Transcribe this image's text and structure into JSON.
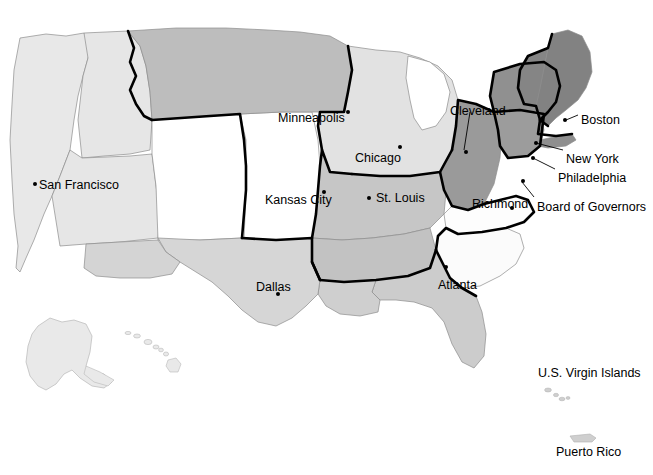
{
  "map": {
    "title": "Federal Reserve Districts Map of the United States",
    "colors": {
      "background": "#ffffff",
      "district_outline": "#000000",
      "state_outline": "#8c8c8c",
      "label_text": "#000000",
      "tone_white": "#ffffff",
      "tone_lightest": "#e8e8e8",
      "tone_lighter": "#dedede",
      "tone_light": "#d2d2d2",
      "tone_mid": "#bdbdbd",
      "tone_dark": "#9a9a9a",
      "tone_darkest": "#808080"
    },
    "reserve_bank_cities": [
      {
        "name": "San Francisco",
        "label_x": 39,
        "label_y": 179,
        "dot_x": 33,
        "dot_y": 182,
        "leader": null
      },
      {
        "name": "Minneapolis",
        "label_x": 278,
        "label_y": 112,
        "dot_x": 346,
        "dot_y": 110,
        "leader": null
      },
      {
        "name": "Kansas City",
        "label_x": 265,
        "label_y": 194,
        "dot_x": 322,
        "dot_y": 190,
        "leader": null
      },
      {
        "name": "Dallas",
        "label_x": 256,
        "label_y": 281,
        "dot_x": 276,
        "dot_y": 292,
        "leader": null
      },
      {
        "name": "Chicago",
        "label_x": 355,
        "label_y": 152,
        "dot_x": 398,
        "dot_y": 145,
        "leader": null
      },
      {
        "name": "St. Louis",
        "label_x": 376,
        "label_y": 192,
        "dot_x": 367,
        "dot_y": 196,
        "leader": null
      },
      {
        "name": "Atlanta",
        "label_x": 438,
        "label_y": 279,
        "dot_x": 444,
        "dot_y": 265,
        "leader": null
      },
      {
        "name": "Cleveland",
        "label_x": 450,
        "label_y": 105,
        "dot_x": 464,
        "dot_y": 152,
        "leader": {
          "x1": 470,
          "y1": 112,
          "x2": 464,
          "y2": 150
        }
      },
      {
        "name": "Richmond",
        "label_x": 472,
        "label_y": 198,
        "dot_x": 510,
        "dot_y": 206,
        "leader": null
      },
      {
        "name": "Boston",
        "label_x": 581,
        "label_y": 114,
        "dot_x": 563,
        "dot_y": 120,
        "leader": {
          "x1": 578,
          "y1": 115,
          "x2": 566,
          "y2": 120
        }
      },
      {
        "name": "New York",
        "label_x": 566,
        "label_y": 153,
        "dot_x": 534,
        "dot_y": 142,
        "leader": {
          "x1": 563,
          "y1": 150,
          "x2": 536,
          "y2": 143
        }
      },
      {
        "name": "Philadelphia",
        "label_x": 558,
        "label_y": 172,
        "dot_x": 531,
        "dot_y": 157,
        "leader": {
          "x1": 555,
          "y1": 169,
          "x2": 533,
          "y2": 158
        }
      },
      {
        "name": "Board of Governors",
        "label_x": 537,
        "label_y": 201,
        "dot_x": 521,
        "dot_y": 180,
        "leader": {
          "x1": 534,
          "y1": 197,
          "x2": 522,
          "y2": 182
        }
      }
    ],
    "territory_labels": [
      {
        "name": "U.S. Virgin Islands",
        "label_x": 538,
        "label_y": 373
      },
      {
        "name": "Puerto Rico",
        "label_x": 556,
        "label_y": 452
      }
    ]
  }
}
